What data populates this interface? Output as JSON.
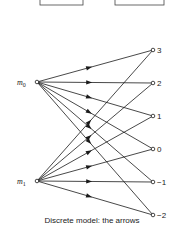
{
  "diagram": {
    "top_boxes": [
      {
        "x": 40,
        "y": -10,
        "w": 43,
        "h": 15
      },
      {
        "x": 115,
        "y": -10,
        "w": 49,
        "h": 15
      }
    ],
    "inputs": [
      {
        "id": "m0",
        "label": "m",
        "sub": "0",
        "x": 37,
        "y": 82
      },
      {
        "id": "m1",
        "label": "m",
        "sub": "1",
        "x": 37,
        "y": 181
      }
    ],
    "outputs": [
      {
        "id": "o3",
        "label": "3",
        "x": 153,
        "y": 50
      },
      {
        "id": "o2",
        "label": "2",
        "x": 153,
        "y": 83
      },
      {
        "id": "o1",
        "label": "1",
        "x": 153,
        "y": 116
      },
      {
        "id": "o0",
        "label": "0",
        "x": 153,
        "y": 149
      },
      {
        "id": "om1",
        "label": "−1",
        "x": 153,
        "y": 182
      },
      {
        "id": "om2",
        "label": "−2",
        "x": 153,
        "y": 215
      }
    ],
    "edges": [
      [
        "m0",
        "o3"
      ],
      [
        "m0",
        "o2"
      ],
      [
        "m0",
        "o1"
      ],
      [
        "m0",
        "o0"
      ],
      [
        "m0",
        "om1"
      ],
      [
        "m0",
        "om2"
      ],
      [
        "m1",
        "o3"
      ],
      [
        "m1",
        "o2"
      ],
      [
        "m1",
        "o1"
      ],
      [
        "m1",
        "o0"
      ],
      [
        "m1",
        "om1"
      ],
      [
        "m1",
        "om2"
      ]
    ],
    "caption": "Discrete model: the arrows",
    "stroke_color": "#1a1a1a"
  }
}
